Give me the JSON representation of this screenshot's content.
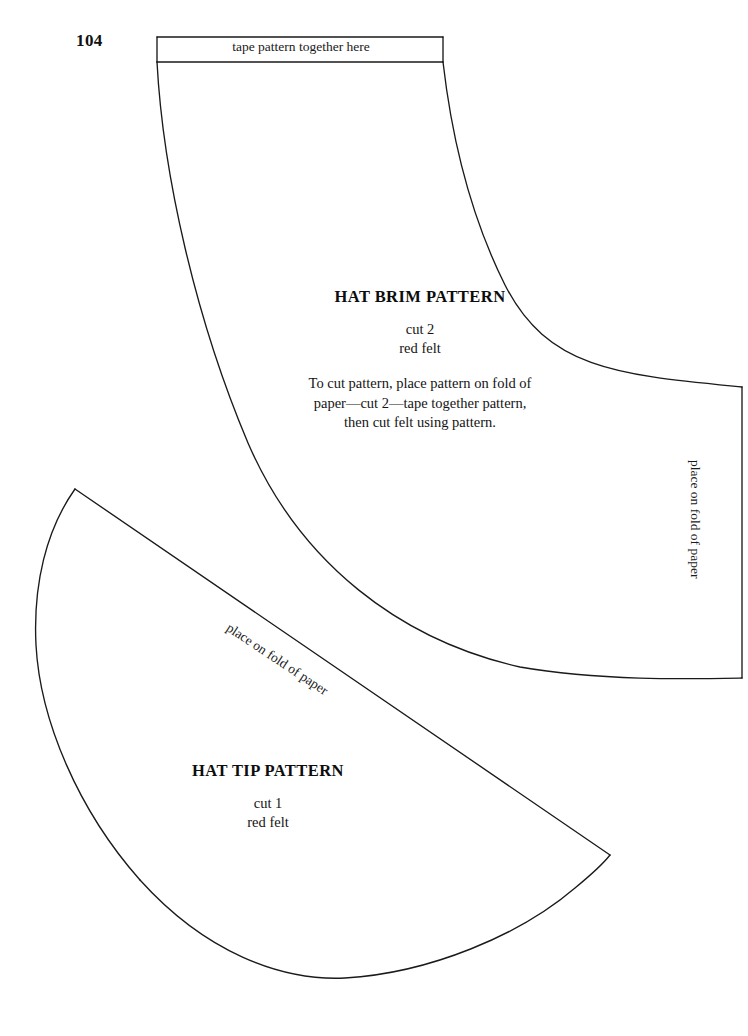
{
  "page": {
    "number": "104",
    "background_color": "#ffffff",
    "line_color": "#1a1a1a"
  },
  "brim": {
    "tape_label": "tape pattern together here",
    "title": "HAT BRIM PATTERN",
    "cut_line": "cut 2",
    "material_line": "red felt",
    "instructions": "To cut pattern, place pattern on fold of paper—cut 2—tape together pattern, then cut felt using pattern.",
    "fold_label": "place on fold of paper"
  },
  "tip": {
    "title": "HAT TIP PATTERN",
    "cut_line": "cut 1",
    "material_line": "red felt",
    "fold_label": "place on fold of paper"
  }
}
